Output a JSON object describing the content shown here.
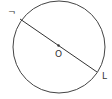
{
  "diagram": {
    "type": "circle-with-diameter",
    "circle": {
      "cx": 59,
      "cy": 47,
      "r": 46,
      "stroke": "#444444"
    },
    "diameter": {
      "x1": 20,
      "y1": 19,
      "x2": 97,
      "y2": 72,
      "stroke": "#333333"
    },
    "center": {
      "x": 58,
      "y": 46,
      "label": "O"
    },
    "endpoint_labels": [
      {
        "text": "¬",
        "x": 9,
        "y": 14
      },
      {
        "text": "L",
        "x": 102,
        "y": 79
      }
    ],
    "colors": {
      "stroke": "#333333",
      "background": "#ffffff"
    }
  }
}
